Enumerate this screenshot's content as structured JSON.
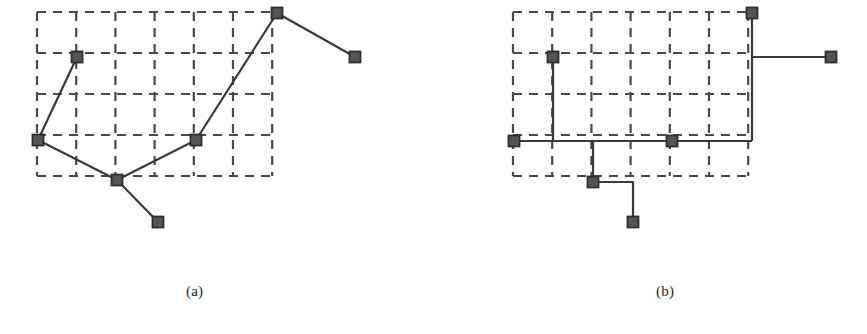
{
  "figure": {
    "background_color": "#ffffff",
    "ink_color": "#3a3a3a",
    "grid_color": "#4a4a4a",
    "node_fill": "#555555",
    "node_stroke": "#2e2e2e",
    "node_size": 11,
    "edge_width": 2.2,
    "grid_dash": "9 7",
    "grid_width": 2.2
  },
  "panels": [
    {
      "id": "a",
      "caption": "(a)",
      "name": "euclidean-steiner-tree-panel",
      "routing": "euclidean",
      "grid": {
        "x0": 37,
        "y0": 12,
        "cols": 6,
        "rows": 4,
        "cell_w": 39.2,
        "cell_h": 41.0,
        "x1": 372.2,
        "y1": 176.0
      },
      "nodes": [
        {
          "id": "a1",
          "label": "node-top-left",
          "x": 77,
          "y": 57
        },
        {
          "id": "a2",
          "label": "node-left",
          "x": 38,
          "y": 140
        },
        {
          "id": "a3",
          "label": "node-center",
          "x": 117,
          "y": 180
        },
        {
          "id": "a4",
          "label": "node-bottom",
          "x": 158,
          "y": 222
        },
        {
          "id": "a5",
          "label": "node-middle-right",
          "x": 196,
          "y": 140
        },
        {
          "id": "a6",
          "label": "node-top",
          "x": 277,
          "y": 13
        },
        {
          "id": "a7",
          "label": "node-right",
          "x": 355,
          "y": 57
        }
      ],
      "edges": [
        {
          "from": "a1",
          "to": "a2"
        },
        {
          "from": "a2",
          "to": "a3"
        },
        {
          "from": "a3",
          "to": "a4"
        },
        {
          "from": "a3",
          "to": "a5"
        },
        {
          "from": "a5",
          "to": "a6"
        },
        {
          "from": "a6",
          "to": "a7"
        }
      ]
    },
    {
      "id": "b",
      "caption": "(b)",
      "name": "rectilinear-steiner-tree-panel",
      "routing": "rectilinear",
      "grid": {
        "x0": 513,
        "y0": 12,
        "cols": 6,
        "rows": 4,
        "cell_w": 39.2,
        "cell_h": 41.0,
        "x1": 848.2,
        "y1": 176.0
      },
      "nodes": [
        {
          "id": "b1",
          "label": "node-top-left",
          "x": 553,
          "y": 57
        },
        {
          "id": "b2",
          "label": "node-left",
          "x": 514,
          "y": 141
        },
        {
          "id": "b3",
          "label": "node-center",
          "x": 593,
          "y": 182
        },
        {
          "id": "b4",
          "label": "node-bottom",
          "x": 633,
          "y": 222
        },
        {
          "id": "b5",
          "label": "node-middle-right",
          "x": 672,
          "y": 141
        },
        {
          "id": "b6",
          "label": "node-top",
          "x": 752,
          "y": 13
        },
        {
          "id": "b7",
          "label": "node-right",
          "x": 831,
          "y": 57
        }
      ],
      "paths": [
        {
          "name": "path-left-to-topleft",
          "points": "514,141 553,141 553,57"
        },
        {
          "name": "path-left-trunk",
          "points": "514,141 752,141"
        },
        {
          "name": "path-center-stub",
          "points": "593,141 593,182"
        },
        {
          "name": "path-center-to-bottom",
          "points": "593,182 633,182 633,222"
        },
        {
          "name": "path-top-vertical",
          "points": "752,141 752,13"
        },
        {
          "name": "path-top-to-right",
          "points": "752,57 831,57"
        }
      ]
    }
  ]
}
